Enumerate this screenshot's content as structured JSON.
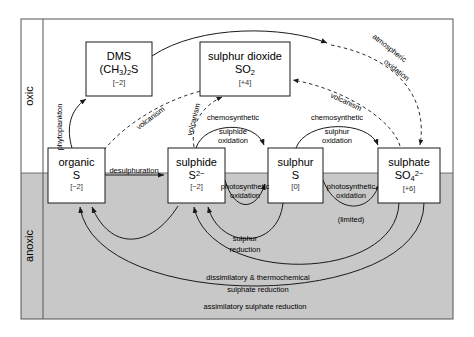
{
  "figure": {
    "colors": {
      "oxic_zone": "#ffffff",
      "anoxic_zone": "#c8c8c8",
      "line": "#1a1a1a",
      "frame": "#555555",
      "box_fill": "#ffffff"
    }
  },
  "zones": [
    {
      "id": "oxic",
      "label": "oxic",
      "fill": "#ffffff"
    },
    {
      "id": "anoxic",
      "label": "anoxic",
      "fill": "#c8c8c8"
    }
  ],
  "boxes": [
    {
      "id": "dms",
      "name": "DMS",
      "formula_html": "(CH<sub>3</sub>)<sub>2</sub>S",
      "oxidation_state": "[−2]",
      "x": 86,
      "y": 42,
      "w": 66,
      "h": 54
    },
    {
      "id": "sulphur-dioxide",
      "name": "sulphur dioxide",
      "formula_html": "SO<sub>2</sub>",
      "oxidation_state": "[+4]",
      "x": 200,
      "y": 42,
      "w": 90,
      "h": 54
    },
    {
      "id": "organic-s",
      "name": "organic",
      "formula_html": "S",
      "oxidation_state": "[−2]",
      "x": 48,
      "y": 148,
      "w": 57,
      "h": 55
    },
    {
      "id": "sulphide",
      "name": "sulphide",
      "formula_html": "S<sup>2−</sup>",
      "oxidation_state": "[−2]",
      "x": 168,
      "y": 148,
      "w": 57,
      "h": 55
    },
    {
      "id": "sulphur",
      "name": "sulphur",
      "formula_html": "S",
      "oxidation_state": "[0]",
      "x": 268,
      "y": 148,
      "w": 55,
      "h": 55
    },
    {
      "id": "sulphate",
      "name": "sulphate",
      "formula_html": "SO<sub>4</sub><sup>2−</sup>",
      "oxidation_state": "[+6]",
      "x": 378,
      "y": 148,
      "w": 62,
      "h": 55
    }
  ],
  "process_labels": [
    {
      "id": "phytoplankton",
      "text": "phytoplankton",
      "style": "solid",
      "rotated": true
    },
    {
      "id": "desulphuration",
      "text": "desulphuration",
      "style": "solid",
      "rotated": false
    },
    {
      "id": "volcanism-organic",
      "text": "volcanism",
      "style": "dashed",
      "rotated": true
    },
    {
      "id": "volcanism-sulphide",
      "text": "volcanism",
      "style": "dashed",
      "rotated": true
    },
    {
      "id": "volcanism-sulphate",
      "text": "volcanism",
      "style": "dashed",
      "rotated": true
    },
    {
      "id": "atmospheric-oxidation",
      "text": "atmospheric oxidation",
      "line1": "atmospheric",
      "line2": "oxidation",
      "style": "dashed",
      "rotated": true
    },
    {
      "id": "chemosynthetic-sulphide-oxidation",
      "header": "chemosynthetic",
      "line1": "sulphide",
      "line2": "oxidation",
      "style": "solid",
      "rotated": false
    },
    {
      "id": "chemosynthetic-sulphur-oxidation",
      "header": "chemosynthetic",
      "line1": "sulphur",
      "line2": "oxidation",
      "style": "solid",
      "rotated": false
    },
    {
      "id": "photosynthetic-sulphide-oxidation",
      "line1": "photosynthetic",
      "line2": "oxidation",
      "style": "solid",
      "rotated": false
    },
    {
      "id": "photosynthetic-sulphur-oxidation",
      "line1": "photosynthetic",
      "line2": "oxidation",
      "note": "(limited)",
      "style": "solid",
      "rotated": false
    },
    {
      "id": "sulphur-reduction",
      "line1": "sulphur",
      "line2": "reduction",
      "style": "solid",
      "rotated": false
    },
    {
      "id": "dissimilatory-sulphate-reduction",
      "line1": "dissimilatory & thermochemical",
      "line2": "sulphate reduction",
      "style": "solid",
      "rotated": false
    },
    {
      "id": "assimilatory-sulphate-reduction",
      "line1": "assimilatory sulphate reduction",
      "style": "solid",
      "rotated": false
    }
  ]
}
